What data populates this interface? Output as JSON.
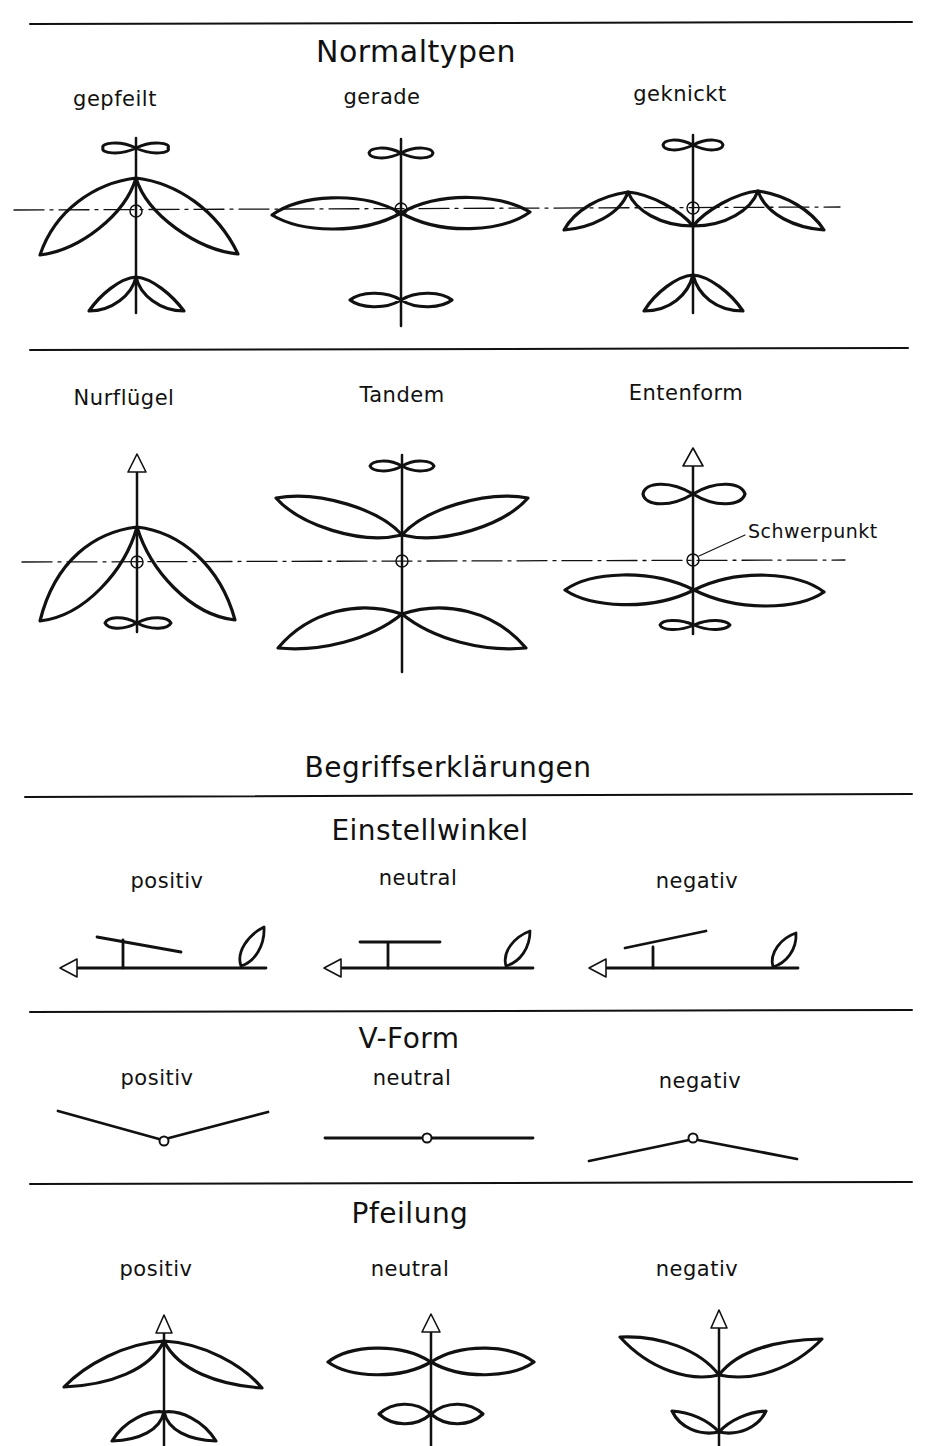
{
  "sections": {
    "normaltypen": {
      "title": "Normaltypen",
      "types": [
        {
          "label": "gepfeilt"
        },
        {
          "label": "gerade"
        },
        {
          "label": "geknickt"
        }
      ]
    },
    "sonderformen": {
      "types": [
        {
          "label": "Nurflügel"
        },
        {
          "label": "Tandem"
        },
        {
          "label": "Entenform"
        }
      ],
      "annotation": "Schwerpunkt"
    },
    "begriffe": {
      "title": "Begriffserklärungen"
    },
    "einstellwinkel": {
      "title": "Einstellwinkel",
      "variants": [
        {
          "label": "positiv"
        },
        {
          "label": "neutral"
        },
        {
          "label": "negativ"
        }
      ]
    },
    "vform": {
      "title": "V-Form",
      "variants": [
        {
          "label": "positiv"
        },
        {
          "label": "neutral"
        },
        {
          "label": "negativ"
        }
      ]
    },
    "pfeilung": {
      "title": "Pfeilung",
      "variants": [
        {
          "label": "positiv"
        },
        {
          "label": "neutral"
        },
        {
          "label": "negativ"
        }
      ]
    }
  },
  "colors": {
    "ink": "#111111",
    "paper": "#ffffff"
  }
}
